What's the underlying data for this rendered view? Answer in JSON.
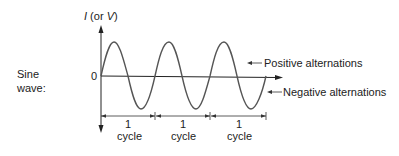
{
  "diagram": {
    "title_label": [
      "Sine",
      "wave:"
    ],
    "y_axis": {
      "label_var": "I",
      "label_mid": " (or ",
      "label_var2": "V",
      "label_end": ")",
      "zero_label": "0"
    },
    "annotations": {
      "positive": "Positive alternations",
      "negative": "Negative alternations"
    },
    "cycles": [
      {
        "count": "1",
        "unit": "cycle"
      },
      {
        "count": "1",
        "unit": "cycle"
      },
      {
        "count": "1",
        "unit": "cycle"
      }
    ],
    "colors": {
      "wave": "#555555",
      "axis": "#222222",
      "text": "#222222"
    }
  }
}
